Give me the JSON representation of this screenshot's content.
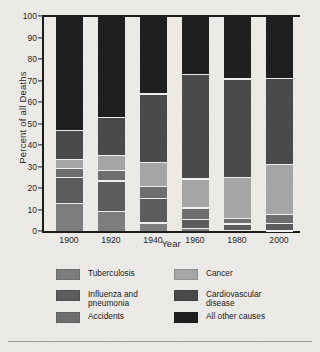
{
  "chart_data": {
    "type": "bar",
    "subtype": "stacked-percentage",
    "title": "",
    "xlabel": "Year",
    "ylabel": "Percent of all Deaths",
    "categories": [
      "1900",
      "1920",
      "1940",
      "1960",
      "1980",
      "2000"
    ],
    "ylim": [
      0,
      100
    ],
    "yticks": [
      "0",
      "10",
      "20",
      "30",
      "40",
      "50",
      "60",
      "70",
      "80",
      "90",
      "100"
    ],
    "ytick_values": [
      0,
      10,
      20,
      30,
      40,
      50,
      60,
      70,
      80,
      90,
      100
    ],
    "grid": false,
    "legend_position": "bottom",
    "series": [
      {
        "name": "Tuberculosis",
        "key": "tuberculosis",
        "color": "#7d7d7d",
        "values": [
          13,
          9.5,
          4,
          1.5,
          0.5,
          0.3
        ]
      },
      {
        "name": "Influenza and pneumonia",
        "key": "influenza_pneumonia",
        "color": "#5c5c5c",
        "values": [
          12,
          14,
          11.5,
          4,
          3,
          3.3
        ]
      },
      {
        "name": "Accidents",
        "key": "accidents",
        "color": "#6e6e6e",
        "values": [
          4.5,
          5,
          5.5,
          5.5,
          2.5,
          4.3
        ]
      },
      {
        "name": "Cancer",
        "key": "cancer",
        "color": "#a5a5a5",
        "values": [
          4,
          7,
          11,
          13.5,
          19,
          23.3
        ]
      },
      {
        "name": "Cardiovascular disease",
        "key": "cardiovascular_disease",
        "color": "#4a4a4a",
        "values": [
          13.5,
          17.5,
          32,
          48.5,
          46,
          40.1
        ]
      },
      {
        "name": "All other causes",
        "key": "all_other_causes",
        "color": "#1f1f1f",
        "values": [
          53,
          47,
          36,
          27,
          29,
          28.7
        ]
      }
    ],
    "stack_order_bottom_to_top": [
      "tuberculosis",
      "influenza_pneumonia",
      "accidents",
      "cancer",
      "cardiovascular_disease",
      "all_other_causes"
    ],
    "bar_totals": [
      100,
      100,
      100,
      100,
      100,
      100
    ]
  },
  "legend": {
    "left": [
      {
        "label": "Tuberculosis",
        "line2": "",
        "color": "#7d7d7d"
      },
      {
        "label": "Influenza and",
        "line2": "pneumonia",
        "color": "#5c5c5c"
      },
      {
        "label": "Accidents",
        "line2": "",
        "color": "#6e6e6e"
      }
    ],
    "right": [
      {
        "label": "Cancer",
        "line2": "",
        "color": "#a5a5a5"
      },
      {
        "label": "Cardiovascular",
        "line2": "disease",
        "color": "#4a4a4a"
      },
      {
        "label": "All other causes",
        "line2": "",
        "color": "#1f1f1f"
      }
    ]
  },
  "colors": {
    "background": "#edebe7",
    "axis": "#1c1c1c",
    "text": "#222222",
    "separator": "#efeeea",
    "bottom_rule": "#9b9b9b"
  }
}
